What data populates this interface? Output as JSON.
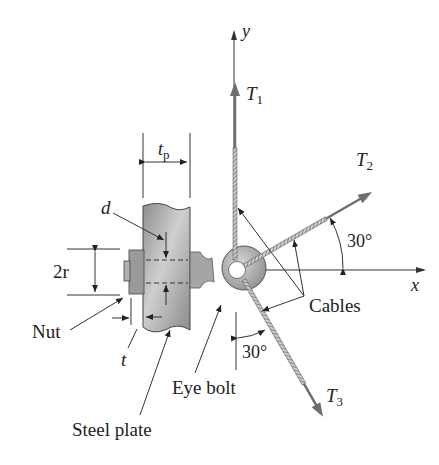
{
  "figure": {
    "axes": {
      "x_label": "x",
      "y_label": "y"
    },
    "forces": [
      {
        "name": "T",
        "sub": "1",
        "direction": "along +y"
      },
      {
        "name": "T",
        "sub": "2",
        "angle_label": "30°",
        "direction": "30° above +x"
      },
      {
        "name": "T",
        "sub": "3",
        "angle_label": "30°",
        "direction": "30° from -y toward +x"
      }
    ],
    "dimensions": {
      "plate_thickness": "t",
      "plate_thickness_sub": "p",
      "bolt_diameter": "d",
      "nut_size": "2r",
      "nut_thickness": "t"
    },
    "labels": {
      "nut": "Nut",
      "steel_plate": "Steel plate",
      "eye_bolt": "Eye bolt",
      "cables": "Cables"
    },
    "colors": {
      "ink": "#222222",
      "arrow_gray": "#6e6e6e",
      "plate_gray": "#a8a8a8"
    }
  }
}
